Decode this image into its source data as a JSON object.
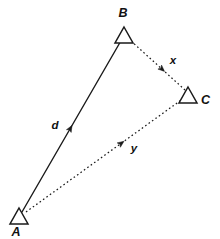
{
  "figure": {
    "type": "vector-triangle-diagram",
    "width": 220,
    "height": 239,
    "background_color": "#ffffff",
    "stroke_color": "#1a1a1a",
    "label_color": "#111111"
  },
  "vertices": [
    {
      "id": "A",
      "label": "A",
      "marker": "open-triangle",
      "point_x": 19,
      "point_y": 208,
      "marker_half_width": 9,
      "marker_height": 16,
      "label_x": 16,
      "label_y": 236,
      "label_anchor": "middle"
    },
    {
      "id": "B",
      "label": "B",
      "marker": "open-triangle",
      "point_x": 124,
      "point_y": 27,
      "marker_half_width": 9,
      "marker_height": 16,
      "label_x": 123,
      "label_y": 17,
      "label_anchor": "middle"
    },
    {
      "id": "C",
      "label": "C",
      "marker": "open-triangle",
      "point_x": 188,
      "point_y": 87,
      "marker_half_width": 9,
      "marker_height": 16,
      "label_x": 201,
      "label_y": 104,
      "label_anchor": "start"
    }
  ],
  "vectors": [
    {
      "id": "d",
      "label": "d",
      "from": "A",
      "to": "B",
      "style": "solid",
      "x1": 22,
      "y1": 212,
      "x2": 122,
      "y2": 39,
      "arrow_t": 0.5,
      "label_x": 55,
      "label_y": 129,
      "label_anchor": "middle"
    },
    {
      "id": "x",
      "label": "x",
      "from": "B",
      "to": "C",
      "style": "dotted",
      "x1": 131,
      "y1": 41,
      "x2": 185,
      "y2": 90,
      "arrow_t": 0.62,
      "label_x": 173,
      "label_y": 64,
      "label_anchor": "middle"
    },
    {
      "id": "y",
      "label": "y",
      "from": "A",
      "to": "C",
      "style": "dotted",
      "x1": 26,
      "y1": 212,
      "x2": 184,
      "y2": 98,
      "arrow_t": 0.62,
      "label_x": 134,
      "label_y": 152,
      "label_anchor": "middle"
    }
  ]
}
